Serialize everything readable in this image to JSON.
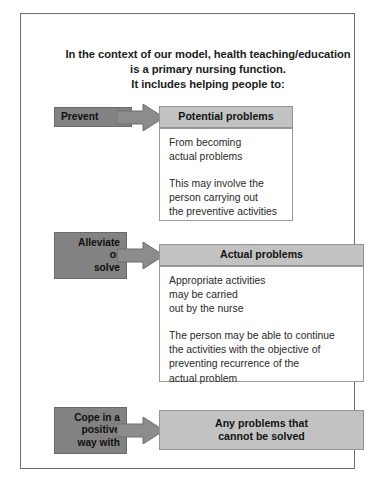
{
  "heading": {
    "line1": "In the context of our model, health teaching/education",
    "line2": "is a primary nursing function.",
    "line3": "It includes helping people to:"
  },
  "colors": {
    "label_fill": "#828282",
    "header_fill": "#c2c2c2",
    "arrow_fill": "#8c8c8c",
    "frame_border": "#6f6f6f",
    "body_border": "#9a9a9a",
    "text": "#1b1b1b"
  },
  "blocks": [
    {
      "label": {
        "line1": "Prevent"
      },
      "arrow": "right-block-arrow",
      "header": {
        "line1": "Potential problems"
      },
      "body": {
        "paragraphs": [
          {
            "lines": [
              "From becoming",
              "actual problems"
            ]
          },
          {
            "lines": [
              "This may involve the",
              "person carrying out",
              "the preventive activities"
            ]
          }
        ]
      }
    },
    {
      "label": {
        "line1": "Alleviate",
        "line2": "or",
        "line3": "solve"
      },
      "arrow": "right-block-arrow",
      "header": {
        "line1": "Actual problems"
      },
      "body": {
        "paragraphs": [
          {
            "lines": [
              "Appropriate activities",
              "may be carried",
              "out by the nurse"
            ]
          },
          {
            "lines": [
              "The person may be able to continue",
              "the activities with the objective of",
              "preventing recurrence of the",
              "actual problem"
            ]
          }
        ]
      }
    },
    {
      "label": {
        "line1": "Cope in a",
        "line2": "positive",
        "line3": "way with"
      },
      "arrow": "right-block-arrow",
      "header": {
        "line1": "Any problems that",
        "line2": "cannot be solved"
      },
      "body": null
    }
  ]
}
